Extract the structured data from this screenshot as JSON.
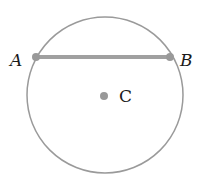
{
  "diagram": {
    "type": "circle-with-chord",
    "circle": {
      "cx": 105,
      "cy": 95,
      "r": 78,
      "stroke": "#9a9a9a"
    },
    "chord": {
      "from": "A",
      "to": "B",
      "stroke": "#a0a0a0"
    },
    "points": [
      {
        "id": "A",
        "label": "A",
        "x": 36,
        "y": 57
      },
      {
        "id": "B",
        "label": "B",
        "x": 170,
        "y": 57
      },
      {
        "id": "C",
        "label": "C",
        "x": 104,
        "y": 96
      }
    ],
    "labels": {
      "A": "A",
      "B": "B",
      "C": "C"
    }
  }
}
